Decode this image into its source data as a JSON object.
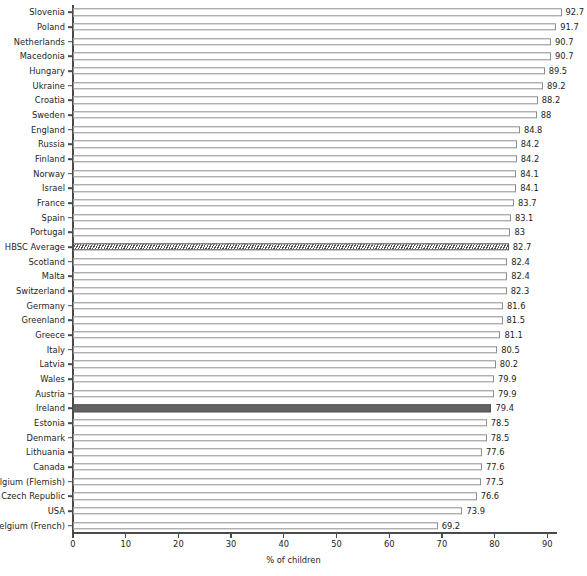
{
  "chart_data": {
    "type": "bar",
    "orientation": "horizontal",
    "title": "",
    "xlabel": "% of children",
    "ylabel": "",
    "xlim": [
      0,
      94
    ],
    "xticks": [
      0,
      10,
      20,
      30,
      40,
      50,
      60,
      70,
      80,
      90
    ],
    "xtick_labels": [
      "0",
      "10",
      "20",
      "30",
      "40",
      "50",
      "60",
      "70",
      "80",
      "90"
    ],
    "grid": false,
    "legend": null,
    "categories": [
      "Slovenia",
      "Poland",
      "Netherlands",
      "Macedonia",
      "Hungary",
      "Ukraine",
      "Croatia",
      "Sweden",
      "England",
      "Russia",
      "Finland",
      "Norway",
      "Israel",
      "France",
      "Spain",
      "Portugal",
      "HBSC Average",
      "Scotland",
      "Malta",
      "Switzerland",
      "Germany",
      "Greenland",
      "Greece",
      "Italy",
      "Latvia",
      "Wales",
      "Austria",
      "Ireland",
      "Estonia",
      "Denmark",
      "Lithuania",
      "Canada",
      "Belgium (Flemish)",
      "Czech Republic",
      "USA",
      "Belgium (French)"
    ],
    "values": [
      92.7,
      91.7,
      90.7,
      90.7,
      89.5,
      89.2,
      88.2,
      88,
      84.8,
      84.2,
      84.2,
      84.1,
      84.1,
      83.7,
      83.1,
      83,
      82.7,
      82.4,
      82.4,
      82.3,
      81.6,
      81.5,
      81.1,
      80.5,
      80.2,
      79.9,
      79.9,
      79.4,
      78.5,
      78.5,
      77.6,
      77.6,
      77.5,
      76.6,
      73.9,
      69.2
    ],
    "value_labels": [
      "92.7",
      "91.7",
      "90.7",
      "90.7",
      "89.5",
      "89.2",
      "88.2",
      "88",
      "84.8",
      "84.2",
      "84.2",
      "84.1",
      "84.1",
      "83.7",
      "83.1",
      "83",
      "82.7",
      "82.4",
      "82.4",
      "82.3",
      "81.6",
      "81.5",
      "81.1",
      "80.5",
      "80.2",
      "79.9",
      "79.9",
      "79.4",
      "78.5",
      "78.5",
      "77.6",
      "77.6",
      "77.5",
      "76.6",
      "73.9",
      "69.2"
    ],
    "bar_styles": [
      "plain",
      "plain",
      "plain",
      "plain",
      "plain",
      "plain",
      "plain",
      "plain",
      "plain",
      "plain",
      "plain",
      "plain",
      "plain",
      "plain",
      "plain",
      "plain",
      "hatched",
      "plain",
      "plain",
      "plain",
      "plain",
      "plain",
      "plain",
      "plain",
      "plain",
      "plain",
      "plain",
      "highlight",
      "plain",
      "plain",
      "plain",
      "plain",
      "plain",
      "plain",
      "plain",
      "plain"
    ],
    "colors": {
      "bar_fill": "#ffffff",
      "bar_edge": "#8d8d8d",
      "highlight_fill": "#636363",
      "hatch_line": "#4f4f4f",
      "axis": "#4a4a4a",
      "text": "#1d1d1d",
      "background": "#ffffff"
    }
  }
}
